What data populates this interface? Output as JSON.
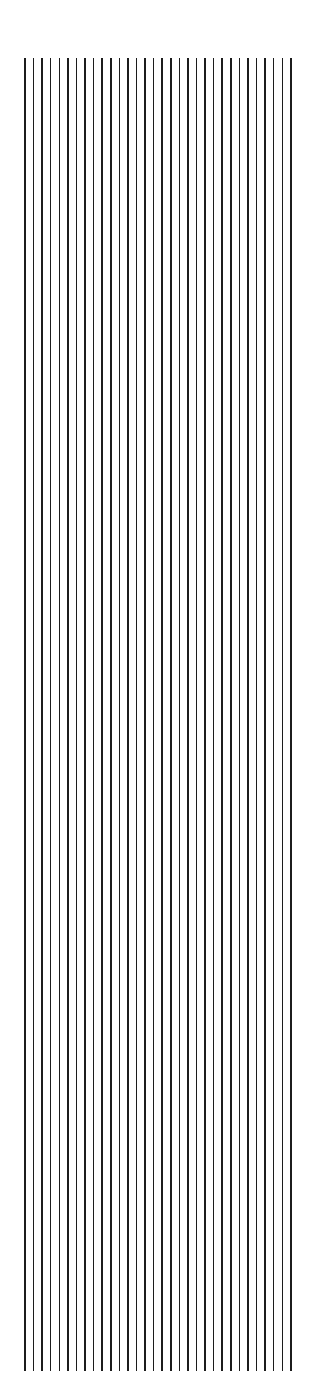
{
  "artwork": {
    "title": "Vertical Line Pattern",
    "background_color": "#ffffff",
    "line_color": "#1c1c1c",
    "canvas": {
      "width": 316,
      "height": 1386
    }
  },
  "chart_data": {
    "type": "line",
    "subtitle": "",
    "xlabel": "",
    "ylabel": "",
    "grid": false,
    "legend_position": "none",
    "orientation": "vertical",
    "line_count": 32,
    "line_color": "#1c1c1c",
    "line_width_px": 1.6,
    "background_color": "#ffffff",
    "x_start_px": 25,
    "x_end_px": 291,
    "x_spacing_px": 8.58,
    "y_top_px": 58,
    "y_bottom_px": 1371,
    "line_length_px": 1313,
    "xlim": [
      0,
      316
    ],
    "ylim": [
      0,
      1386
    ],
    "x": [
      25,
      33.6,
      42.2,
      50.7,
      59.3,
      67.9,
      76.5,
      85.0,
      93.6,
      102.2,
      110.8,
      119.3,
      127.9,
      136.5,
      145.1,
      153.6,
      162.2,
      170.8,
      179.4,
      187.9,
      196.5,
      205.1,
      213.7,
      222.2,
      230.8,
      239.4,
      248.0,
      256.5,
      265.1,
      273.7,
      282.3,
      291
    ],
    "y_top": [
      58,
      58,
      58,
      58,
      58,
      58,
      58,
      58,
      58,
      58,
      58,
      58,
      58,
      58,
      58,
      58,
      58,
      58,
      58,
      58,
      58,
      58,
      58,
      58,
      58,
      58,
      58,
      58,
      58,
      58,
      58,
      58
    ],
    "y_bottom": [
      1371,
      1371,
      1371,
      1371,
      1371,
      1371,
      1371,
      1371,
      1371,
      1371,
      1371,
      1371,
      1371,
      1371,
      1371,
      1371,
      1371,
      1371,
      1371,
      1371,
      1371,
      1371,
      1371,
      1371,
      1371,
      1371,
      1371,
      1371,
      1371,
      1371,
      1371,
      1371
    ]
  }
}
